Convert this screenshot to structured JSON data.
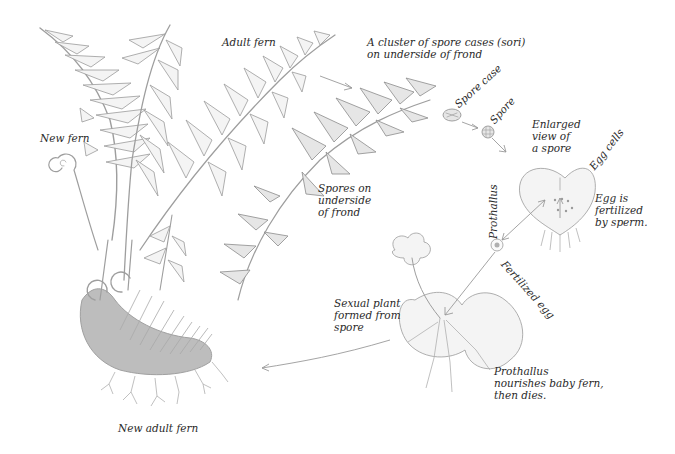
{
  "diagram": {
    "colors": {
      "background": "#ffffff",
      "drawing": "#9e9e9e",
      "text": "#2a2a2a"
    },
    "labels": {
      "adult_fern": "Adult fern",
      "spore_cluster_line1": "A cluster of spore cases (sori)",
      "spore_cluster_line2": "on underside of frond",
      "spore_case": "Spore case",
      "spore": "Spore",
      "enlarged_line1": "Enlarged",
      "enlarged_line2": "view of",
      "enlarged_line3": "a spore",
      "egg_cells": "Egg cells",
      "egg_fert_line1": "Egg is",
      "egg_fert_line2": "fertilized",
      "egg_fert_line3": "by sperm.",
      "prothallus": "Prothallus",
      "fertilized_egg": "Fertilized egg",
      "new_fern": "New fern",
      "spores_underside_line1": "Spores on",
      "spores_underside_line2": "underside",
      "spores_underside_line3": "of frond",
      "sexual_plant_line1": "Sexual plant",
      "sexual_plant_line2": "formed from",
      "sexual_plant_line3": "spore",
      "prothallus_nourishes_line1": "Prothallus",
      "prothallus_nourishes_line2": "nourishes baby fern,",
      "prothallus_nourishes_line3": "then dies.",
      "new_adult_fern": "New adult fern"
    },
    "stages": [
      "Adult fern",
      "Spore case",
      "Spore",
      "Prothallus",
      "Fertilized egg",
      "Sexual plant formed from spore",
      "New adult fern"
    ]
  }
}
